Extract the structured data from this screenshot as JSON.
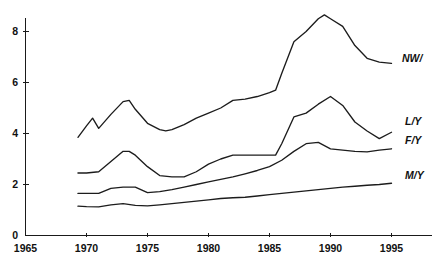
{
  "chart_data": {
    "type": "line",
    "title": "",
    "subtitle": "",
    "xlabel": "",
    "ylabel": "",
    "xlim": [
      1965,
      1997
    ],
    "ylim": [
      0,
      9.1
    ],
    "grid": false,
    "legend_position": "right-inline",
    "x_ticks": [
      1965,
      1970,
      1975,
      1980,
      1985,
      1990,
      1995
    ],
    "x_tick_labels": [
      "1965",
      "1970",
      "1975",
      "1980",
      "1985",
      "1990",
      "1995"
    ],
    "y_ticks": [
      0,
      2,
      4,
      6,
      8
    ],
    "y_tick_labels": [
      "0",
      "2",
      "4",
      "6",
      "8"
    ],
    "series": [
      {
        "name": "NW/",
        "label": "NW/",
        "color": "#1c1c1c",
        "x": [
          1969.3,
          1970,
          1970.5,
          1971,
          1972,
          1973,
          1973.5,
          1974,
          1975,
          1976,
          1976.5,
          1977,
          1978,
          1979,
          1980,
          1981,
          1982,
          1983,
          1984,
          1985,
          1985.5,
          1986,
          1987,
          1988,
          1989,
          1989.5,
          1990,
          1991,
          1992,
          1993,
          1994,
          1995
        ],
        "values": [
          3.85,
          4.3,
          4.6,
          4.2,
          4.75,
          5.25,
          5.3,
          4.95,
          4.4,
          4.15,
          4.1,
          4.15,
          4.35,
          4.6,
          4.8,
          5.0,
          5.3,
          5.35,
          5.45,
          5.6,
          5.7,
          6.35,
          7.6,
          8.0,
          8.5,
          8.65,
          8.5,
          8.2,
          7.45,
          6.95,
          6.8,
          6.75
        ]
      },
      {
        "name": "L/Y",
        "label": "L/Y",
        "color": "#1c1c1c",
        "x": [
          1969.3,
          1970,
          1971,
          1972,
          1973,
          1973.5,
          1974,
          1975,
          1976,
          1977,
          1978,
          1979,
          1980,
          1981,
          1982,
          1983,
          1984,
          1985,
          1985.5,
          1986,
          1987,
          1988,
          1989,
          1990,
          1991,
          1992,
          1993,
          1994,
          1995
        ],
        "values": [
          2.45,
          2.45,
          2.5,
          2.9,
          3.3,
          3.3,
          3.15,
          2.7,
          2.35,
          2.3,
          2.3,
          2.5,
          2.8,
          3.0,
          3.15,
          3.15,
          3.15,
          3.15,
          3.15,
          3.6,
          4.65,
          4.8,
          5.15,
          5.45,
          5.1,
          4.45,
          4.1,
          3.8,
          4.05
        ]
      },
      {
        "name": "F/Y",
        "label": "F/Y",
        "color": "#1c1c1c",
        "x": [
          1969.3,
          1970,
          1971,
          1972,
          1973,
          1974,
          1975,
          1976,
          1977,
          1978,
          1979,
          1980,
          1981,
          1982,
          1983,
          1984,
          1985,
          1986,
          1987,
          1988,
          1989,
          1990,
          1991,
          1992,
          1993,
          1994,
          1995
        ],
        "values": [
          1.65,
          1.65,
          1.65,
          1.85,
          1.9,
          1.9,
          1.68,
          1.72,
          1.8,
          1.9,
          2.0,
          2.1,
          2.2,
          2.3,
          2.42,
          2.55,
          2.7,
          2.95,
          3.3,
          3.6,
          3.65,
          3.4,
          3.35,
          3.3,
          3.28,
          3.35,
          3.4
        ]
      },
      {
        "name": "M/Y",
        "label": "M/Y",
        "color": "#1c1c1c",
        "x": [
          1969.3,
          1970,
          1971,
          1972,
          1973,
          1974,
          1975,
          1976,
          1977,
          1978,
          1979,
          1980,
          1981,
          1982,
          1983,
          1984,
          1985,
          1986,
          1987,
          1988,
          1989,
          1990,
          1991,
          1992,
          1993,
          1994,
          1995
        ],
        "values": [
          1.15,
          1.13,
          1.12,
          1.2,
          1.25,
          1.18,
          1.16,
          1.2,
          1.25,
          1.3,
          1.35,
          1.4,
          1.45,
          1.48,
          1.5,
          1.55,
          1.6,
          1.65,
          1.7,
          1.75,
          1.8,
          1.85,
          1.9,
          1.93,
          1.97,
          2.0,
          2.05
        ]
      }
    ],
    "series_label_positions": [
      {
        "name": "NW/",
        "x": 402,
        "y": 52
      },
      {
        "name": "L/Y",
        "x": 405,
        "y": 115
      },
      {
        "name": "F/Y",
        "x": 405,
        "y": 134
      },
      {
        "name": "M/Y",
        "x": 405,
        "y": 169
      }
    ]
  }
}
